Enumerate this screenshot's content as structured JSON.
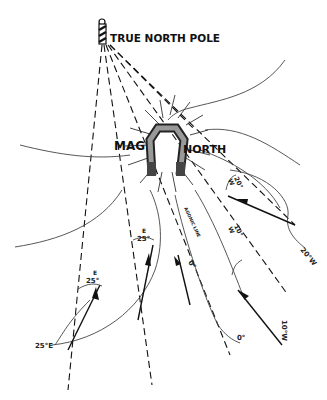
{
  "diagram": {
    "title": "TRUE NORTH POLE",
    "magnetic_label_left": "MAG",
    "magnetic_label_right": "NORTH",
    "agonic_line_label": "AGONIC LINE",
    "isogonic_labels": {
      "east_25": "25°E",
      "zero": "0°",
      "west_10": "10°W",
      "west_20": "20°W"
    },
    "angle_labels": [
      {
        "direction": "E",
        "value": "25°"
      },
      {
        "direction": "E",
        "value": "25°"
      },
      {
        "direction": "",
        "value": "0°"
      },
      {
        "direction": "W",
        "value": "10°"
      },
      {
        "direction": "W",
        "value": "20°"
      }
    ],
    "icons": {
      "pole": "striped-pole-icon",
      "magnet": "horseshoe-magnet-icon"
    }
  }
}
